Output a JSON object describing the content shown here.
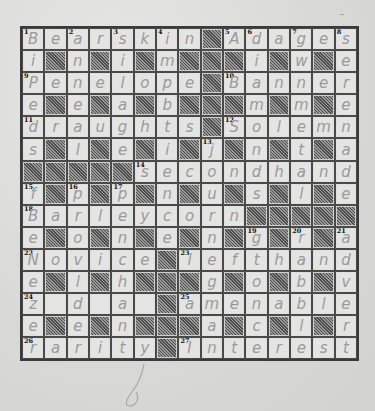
{
  "puzzle": {
    "type": "crossword",
    "rows": 15,
    "cols": 15,
    "grid": [
      [
        "B",
        "e",
        "a",
        "r",
        "s",
        "k",
        "i",
        "n",
        "#",
        "A",
        "d",
        "a",
        "g",
        "e",
        "s"
      ],
      [
        "i",
        "#",
        "n",
        "#",
        "i",
        "#",
        "m",
        "#",
        "#",
        "#",
        "i",
        "#",
        "w",
        "#",
        "e"
      ],
      [
        "P",
        "e",
        "n",
        "e",
        "l",
        "o",
        "p",
        "e",
        "#",
        "B",
        "a",
        "n",
        "n",
        "e",
        "r"
      ],
      [
        "e",
        "#",
        "e",
        "#",
        "a",
        "#",
        "b",
        "#",
        "#",
        "#",
        "m",
        "#",
        "m",
        "#",
        "e"
      ],
      [
        "d",
        "r",
        "a",
        "u",
        "g",
        "h",
        "t",
        "s",
        "#",
        "S",
        "o",
        "l",
        "e",
        "m",
        "n"
      ],
      [
        "s",
        "#",
        "l",
        "#",
        "e",
        "#",
        "i",
        "#",
        "j",
        "#",
        "n",
        "#",
        "t",
        "#",
        "a"
      ],
      [
        "#",
        "#",
        "#",
        "#",
        "#",
        "s",
        "e",
        "c",
        "o",
        "n",
        "d",
        "h",
        "a",
        "n",
        "d"
      ],
      [
        "f",
        "#",
        "p",
        "#",
        "p",
        "#",
        "n",
        "#",
        "u",
        "#",
        "s",
        "#",
        "l",
        "#",
        "e"
      ],
      [
        "B",
        "a",
        "r",
        "l",
        "e",
        "y",
        "c",
        "o",
        "r",
        "n",
        "#",
        "#",
        "#",
        "#",
        "#"
      ],
      [
        "e",
        "#",
        "o",
        "#",
        "n",
        "#",
        "e",
        "#",
        "n",
        "#",
        "g",
        "#",
        "r",
        "#",
        "a"
      ],
      [
        "N",
        "o",
        "v",
        "i",
        "c",
        "e",
        "#",
        "l",
        "e",
        "f",
        "t",
        "h",
        "a",
        "n",
        "d"
      ],
      [
        "e",
        "#",
        "l",
        "#",
        "h",
        "#",
        "#",
        "#",
        "g",
        "#",
        "o",
        "#",
        "b",
        "#",
        "v"
      ],
      [
        "z",
        "",
        "d",
        "",
        "a",
        "",
        "#",
        "a",
        "m",
        "e",
        "n",
        "a",
        "b",
        "l",
        "e"
      ],
      [
        "e",
        "#",
        "e",
        "#",
        "n",
        "#",
        "#",
        "#",
        "a",
        "#",
        "c",
        "#",
        "l",
        "#",
        "r"
      ],
      [
        "r",
        "a",
        "r",
        "i",
        "t",
        "y",
        "#",
        "I",
        "n",
        "t",
        "e",
        "r",
        "e",
        "s",
        "t"
      ]
    ],
    "numbers": [
      {
        "r": 0,
        "c": 0,
        "n": "1"
      },
      {
        "r": 0,
        "c": 2,
        "n": "2"
      },
      {
        "r": 0,
        "c": 4,
        "n": "3"
      },
      {
        "r": 0,
        "c": 6,
        "n": "4"
      },
      {
        "r": 0,
        "c": 9,
        "n": "5"
      },
      {
        "r": 0,
        "c": 10,
        "n": "6"
      },
      {
        "r": 0,
        "c": 12,
        "n": "7"
      },
      {
        "r": 0,
        "c": 14,
        "n": "8"
      },
      {
        "r": 2,
        "c": 0,
        "n": "9"
      },
      {
        "r": 2,
        "c": 9,
        "n": "10"
      },
      {
        "r": 4,
        "c": 0,
        "n": "11"
      },
      {
        "r": 4,
        "c": 9,
        "n": "12"
      },
      {
        "r": 5,
        "c": 8,
        "n": "13"
      },
      {
        "r": 6,
        "c": 5,
        "n": "14"
      },
      {
        "r": 7,
        "c": 0,
        "n": "15"
      },
      {
        "r": 7,
        "c": 2,
        "n": "16"
      },
      {
        "r": 7,
        "c": 4,
        "n": "17"
      },
      {
        "r": 8,
        "c": 0,
        "n": "18"
      },
      {
        "r": 9,
        "c": 10,
        "n": "19"
      },
      {
        "r": 9,
        "c": 12,
        "n": "20"
      },
      {
        "r": 9,
        "c": 14,
        "n": "21"
      },
      {
        "r": 10,
        "c": 0,
        "n": "22"
      },
      {
        "r": 10,
        "c": 7,
        "n": "23"
      },
      {
        "r": 12,
        "c": 0,
        "n": "24"
      },
      {
        "r": 12,
        "c": 7,
        "n": "25"
      },
      {
        "r": 14,
        "c": 0,
        "n": "26"
      },
      {
        "r": 14,
        "c": 7,
        "n": "27"
      }
    ],
    "entries_across": [
      {
        "n": "1",
        "answer": "Bearskin"
      },
      {
        "n": "5",
        "answer": "Adages"
      },
      {
        "n": "9",
        "answer": "Penelope"
      },
      {
        "n": "10",
        "answer": "Banner"
      },
      {
        "n": "11",
        "answer": "draughts"
      },
      {
        "n": "12",
        "answer": "Solemn"
      },
      {
        "n": "14",
        "answer": "secondhand"
      },
      {
        "n": "18",
        "answer": "Barleycorn"
      },
      {
        "n": "22",
        "answer": "Novice"
      },
      {
        "n": "23",
        "answer": "lefthand"
      },
      {
        "n": "24",
        "answer": "z d a"
      },
      {
        "n": "25",
        "answer": "amenable"
      },
      {
        "n": "26",
        "answer": "rarity"
      },
      {
        "n": "27",
        "answer": "Interest"
      }
    ],
    "colors": {
      "paper": "#dcdcda",
      "cell": "#e4e4e2",
      "black_cell": "#6e6e6e",
      "grid_line": "#3a3a3a",
      "pencil": "#9a9a9c"
    }
  }
}
